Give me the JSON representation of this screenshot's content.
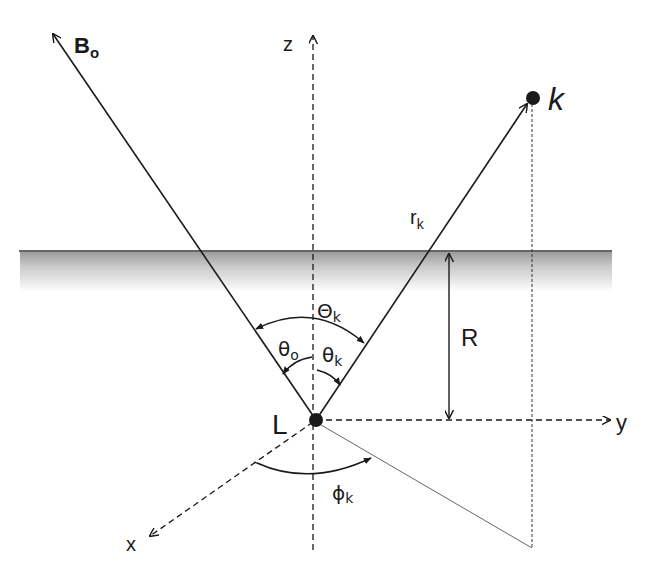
{
  "diagram": {
    "labels": {
      "b0_main": "B",
      "b0_sub": "o",
      "z_axis": "z",
      "y_axis": "y",
      "x_axis": "x",
      "point_k": "k",
      "point_L": "L",
      "r_main": "r",
      "r_sub": "k",
      "R": "R",
      "Theta_main": "Θ",
      "Theta_sub": "k",
      "theta_o_main": "θ",
      "theta_o_sub": "o",
      "theta_k_main": "θ",
      "theta_k_sub": "k",
      "phi_main": "ϕ",
      "phi_sub": "k"
    },
    "elements": [
      "surface-line",
      "b0-vector",
      "rk-vector",
      "z-axis",
      "y-axis",
      "x-axis",
      "R-dimension",
      "Theta_k-angle-arc",
      "theta_o-angle-arc",
      "theta_k-angle-arc",
      "phi_k-angle-arc",
      "projection-lines"
    ],
    "colors": {
      "ink": "#1a1a1a",
      "shade": "#a8a8a8"
    }
  }
}
